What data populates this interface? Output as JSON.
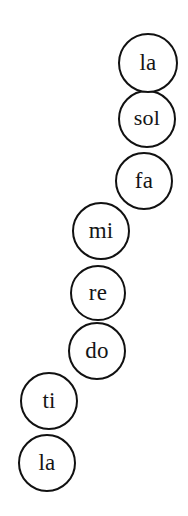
{
  "figure": {
    "type": "diagram",
    "canvas": {
      "width": 188,
      "height": 516
    },
    "background_color": "#ffffff",
    "circle_stroke_color": "#111111",
    "circle_fill_color": "#ffffff",
    "circle_stroke_width": 2,
    "label_color": "#151515"
  },
  "notes": [
    {
      "label": "la",
      "left": 118,
      "top": 33,
      "size": 60,
      "font_size": 23,
      "z": 8
    },
    {
      "label": "sol",
      "left": 118,
      "top": 90,
      "size": 58,
      "font_size": 22,
      "z": 7
    },
    {
      "label": "fa",
      "left": 115,
      "top": 152,
      "size": 58,
      "font_size": 23,
      "z": 6
    },
    {
      "label": "mi",
      "left": 72,
      "top": 202,
      "size": 58,
      "font_size": 23,
      "z": 5
    },
    {
      "label": "re",
      "left": 70,
      "top": 265,
      "size": 56,
      "font_size": 23,
      "z": 4
    },
    {
      "label": "do",
      "left": 68,
      "top": 322,
      "size": 58,
      "font_size": 23,
      "z": 3
    },
    {
      "label": "ti",
      "left": 20,
      "top": 372,
      "size": 58,
      "font_size": 23,
      "z": 2
    },
    {
      "label": "la",
      "left": 18,
      "top": 434,
      "size": 58,
      "font_size": 23,
      "z": 1
    }
  ]
}
